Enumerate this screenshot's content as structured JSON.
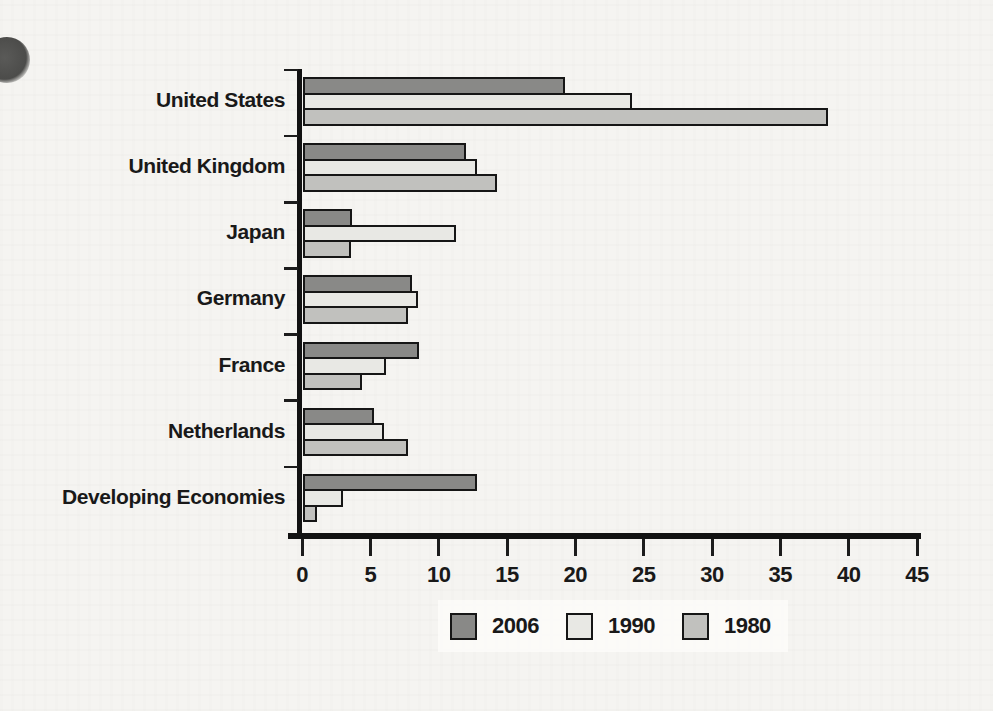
{
  "page": {
    "background_color": "#f5f4f1",
    "decoration": "partial dark circle on left margin of scanned page"
  },
  "chart_data": {
    "type": "bar",
    "orientation": "horizontal",
    "title": "",
    "xlabel": "",
    "ylabel": "",
    "grid": false,
    "legend_position": "bottom",
    "xlim": [
      0,
      45
    ],
    "x_ticks": [
      0,
      5,
      10,
      15,
      20,
      25,
      30,
      35,
      40,
      45
    ],
    "categories": [
      "United States",
      "United Kingdom",
      "Japan",
      "Germany",
      "France",
      "Netherlands",
      "Developing Economies"
    ],
    "series": [
      {
        "name": "2006",
        "color": "#898987",
        "values": [
          19.2,
          11.9,
          3.6,
          8.0,
          8.5,
          5.2,
          12.7
        ]
      },
      {
        "name": "1990",
        "color": "#e8e8e4",
        "values": [
          24.1,
          12.7,
          11.2,
          8.4,
          6.1,
          5.9,
          2.9
        ]
      },
      {
        "name": "1980",
        "color": "#c1c1be",
        "values": [
          38.4,
          14.2,
          3.5,
          7.7,
          4.3,
          7.7,
          1.0
        ]
      }
    ],
    "colors": {
      "bar_border": "#161616",
      "axis": "#121212",
      "text": "#191919"
    }
  },
  "legend": {
    "items": [
      {
        "label": "2006"
      },
      {
        "label": "1990"
      },
      {
        "label": "1980"
      }
    ]
  }
}
